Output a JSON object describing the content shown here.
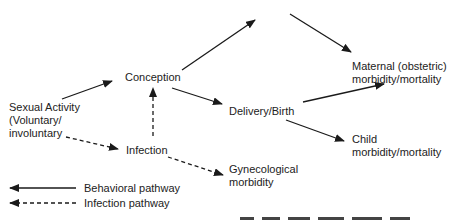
{
  "diagram": {
    "type": "flow",
    "nodes": {
      "sexual_activity": {
        "lines": [
          "Sexual Activity",
          "(Voluntary/",
          "involuntary"
        ]
      },
      "conception": {
        "label": "Conception"
      },
      "infection": {
        "label": "Infection"
      },
      "delivery": {
        "label": "Delivery/Birth"
      },
      "maternal": {
        "lines": [
          "Maternal (obstetric)",
          "morbidity/mortality"
        ]
      },
      "child": {
        "lines": [
          "Child",
          "morbidity/mortality"
        ]
      },
      "gynecological": {
        "lines": [
          "Gynecological",
          "morbidity"
        ]
      }
    },
    "edges": [
      {
        "from": "sexual_activity",
        "to": "conception",
        "style": "solid"
      },
      {
        "from": "conception",
        "to": "(off-frame top)",
        "style": "solid"
      },
      {
        "from": "(off-frame top)",
        "to": "maternal",
        "style": "solid"
      },
      {
        "from": "conception",
        "to": "delivery",
        "style": "solid"
      },
      {
        "from": "delivery",
        "to": "maternal",
        "style": "solid"
      },
      {
        "from": "delivery",
        "to": "child",
        "style": "solid"
      },
      {
        "from": "sexual_activity",
        "to": "infection",
        "style": "dashed"
      },
      {
        "from": "infection",
        "to": "conception",
        "style": "dashed"
      },
      {
        "from": "infection",
        "to": "gynecological",
        "style": "dashed"
      }
    ],
    "legend": {
      "behavioral": "Behavioral pathway",
      "infection": "Infection pathway"
    },
    "colors": {
      "line": "#1a1a1a",
      "text": "#222222",
      "background": "#ffffff"
    }
  }
}
